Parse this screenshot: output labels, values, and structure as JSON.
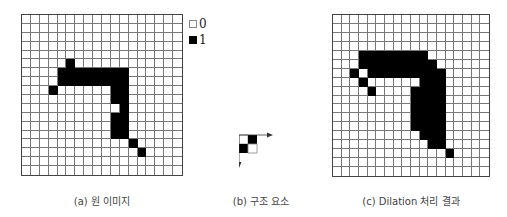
{
  "legend": {
    "items": [
      {
        "swatch": "white",
        "label": "0"
      },
      {
        "swatch": "black",
        "label": "1"
      }
    ]
  },
  "colors": {
    "on": "#000000",
    "off": "#ffffff",
    "gridline": "#777777"
  },
  "panels": {
    "original": {
      "caption": "(a) 원 이미지",
      "rows": 18,
      "cols": 18,
      "on_cells": [
        [
          5,
          5
        ],
        [
          6,
          4
        ],
        [
          6,
          5
        ],
        [
          6,
          6
        ],
        [
          6,
          7
        ],
        [
          6,
          8
        ],
        [
          6,
          9
        ],
        [
          6,
          10
        ],
        [
          6,
          11
        ],
        [
          7,
          4
        ],
        [
          7,
          5
        ],
        [
          7,
          6
        ],
        [
          7,
          7
        ],
        [
          7,
          8
        ],
        [
          7,
          9
        ],
        [
          7,
          10
        ],
        [
          7,
          11
        ],
        [
          8,
          3
        ],
        [
          8,
          10
        ],
        [
          8,
          11
        ],
        [
          9,
          10
        ],
        [
          9,
          11
        ],
        [
          10,
          11
        ],
        [
          11,
          10
        ],
        [
          11,
          11
        ],
        [
          12,
          10
        ],
        [
          12,
          11
        ],
        [
          13,
          10
        ],
        [
          13,
          11
        ],
        [
          14,
          12
        ],
        [
          15,
          13
        ]
      ]
    },
    "structuring_element": {
      "caption": "(b) 구조 요소",
      "rows": 2,
      "cols": 2,
      "on_cells": [
        [
          0,
          1
        ],
        [
          1,
          0
        ]
      ],
      "axes": {
        "x_arrow": "right",
        "y_arrow": "down"
      }
    },
    "dilation": {
      "caption": "(c) Dilation 처리 결과",
      "rows": 18,
      "cols": 18,
      "on_cells": [
        [
          4,
          3
        ],
        [
          4,
          4
        ],
        [
          4,
          5
        ],
        [
          4,
          6
        ],
        [
          4,
          7
        ],
        [
          4,
          8
        ],
        [
          4,
          9
        ],
        [
          4,
          10
        ],
        [
          5,
          3
        ],
        [
          5,
          4
        ],
        [
          5,
          5
        ],
        [
          5,
          6
        ],
        [
          5,
          7
        ],
        [
          5,
          8
        ],
        [
          5,
          9
        ],
        [
          5,
          10
        ],
        [
          5,
          11
        ],
        [
          6,
          2
        ],
        [
          6,
          4
        ],
        [
          6,
          5
        ],
        [
          6,
          6
        ],
        [
          6,
          7
        ],
        [
          6,
          8
        ],
        [
          6,
          9
        ],
        [
          6,
          10
        ],
        [
          6,
          11
        ],
        [
          6,
          12
        ],
        [
          7,
          3
        ],
        [
          7,
          10
        ],
        [
          7,
          11
        ],
        [
          7,
          12
        ],
        [
          8,
          4
        ],
        [
          8,
          9
        ],
        [
          8,
          10
        ],
        [
          8,
          11
        ],
        [
          8,
          12
        ],
        [
          9,
          9
        ],
        [
          9,
          10
        ],
        [
          9,
          11
        ],
        [
          9,
          12
        ],
        [
          10,
          9
        ],
        [
          10,
          10
        ],
        [
          10,
          11
        ],
        [
          10,
          12
        ],
        [
          11,
          9
        ],
        [
          11,
          10
        ],
        [
          11,
          11
        ],
        [
          11,
          12
        ],
        [
          12,
          9
        ],
        [
          12,
          10
        ],
        [
          12,
          11
        ],
        [
          12,
          12
        ],
        [
          13,
          10
        ],
        [
          13,
          11
        ],
        [
          13,
          12
        ],
        [
          14,
          11
        ],
        [
          14,
          12
        ],
        [
          15,
          13
        ]
      ]
    }
  }
}
